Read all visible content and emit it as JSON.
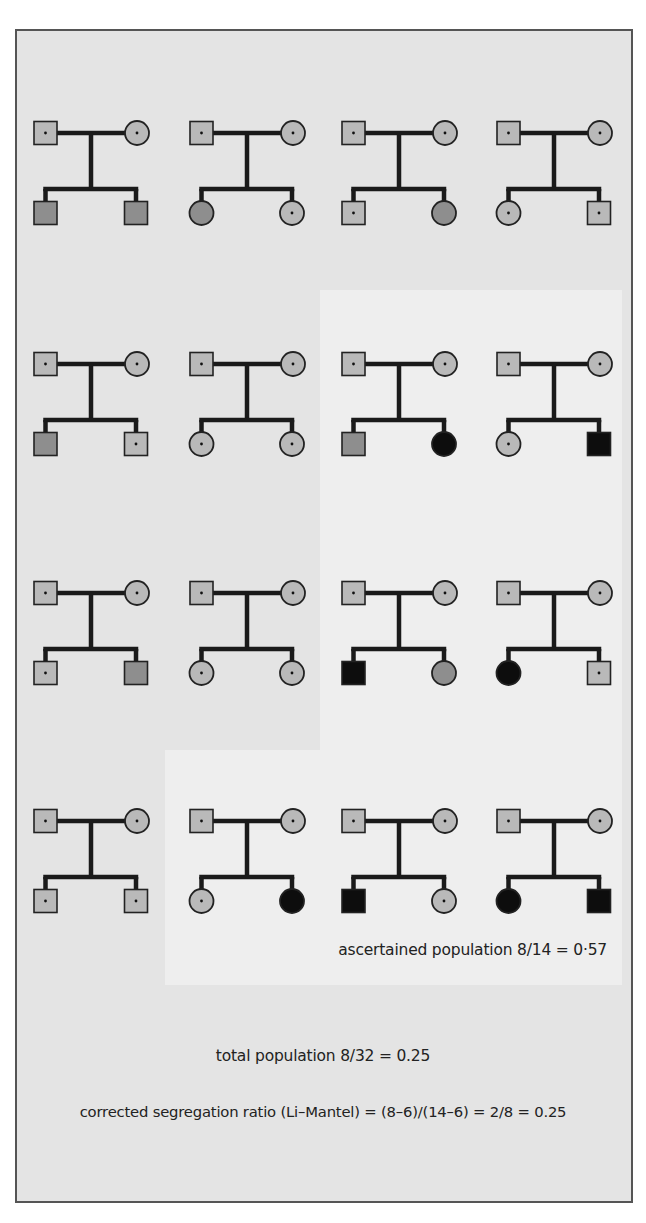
{
  "colors": {
    "frame_bg": "#e4e4e4",
    "panel_bg": "#eeeeee",
    "line": "#1a1a1a",
    "carrier_fill": "#b9b9b9",
    "gray_fill": "#8e8e8e",
    "affected_fill": "#0d0d0d",
    "border": "#555555"
  },
  "legend_semantics": {
    "dot": "carrier (unaffected heterozygote)",
    "gray": "unaffected non-carrier",
    "black": "affected"
  },
  "families": [
    {
      "row": 0,
      "col": 0,
      "children": [
        {
          "sex": "M",
          "state": "gray"
        },
        {
          "sex": "M",
          "state": "gray"
        }
      ]
    },
    {
      "row": 0,
      "col": 1,
      "children": [
        {
          "sex": "F",
          "state": "gray"
        },
        {
          "sex": "F",
          "state": "dot"
        }
      ]
    },
    {
      "row": 0,
      "col": 2,
      "children": [
        {
          "sex": "M",
          "state": "dot"
        },
        {
          "sex": "F",
          "state": "gray"
        }
      ]
    },
    {
      "row": 0,
      "col": 3,
      "children": [
        {
          "sex": "F",
          "state": "dot"
        },
        {
          "sex": "M",
          "state": "dot"
        }
      ]
    },
    {
      "row": 1,
      "col": 0,
      "children": [
        {
          "sex": "M",
          "state": "gray"
        },
        {
          "sex": "M",
          "state": "dot"
        }
      ]
    },
    {
      "row": 1,
      "col": 1,
      "children": [
        {
          "sex": "F",
          "state": "dot"
        },
        {
          "sex": "F",
          "state": "dot"
        }
      ]
    },
    {
      "row": 1,
      "col": 2,
      "children": [
        {
          "sex": "M",
          "state": "gray"
        },
        {
          "sex": "F",
          "state": "black"
        }
      ]
    },
    {
      "row": 1,
      "col": 3,
      "children": [
        {
          "sex": "F",
          "state": "dot"
        },
        {
          "sex": "M",
          "state": "black"
        }
      ]
    },
    {
      "row": 2,
      "col": 0,
      "children": [
        {
          "sex": "M",
          "state": "dot"
        },
        {
          "sex": "M",
          "state": "gray"
        }
      ]
    },
    {
      "row": 2,
      "col": 1,
      "children": [
        {
          "sex": "F",
          "state": "dot"
        },
        {
          "sex": "F",
          "state": "dot"
        }
      ]
    },
    {
      "row": 2,
      "col": 2,
      "children": [
        {
          "sex": "M",
          "state": "black"
        },
        {
          "sex": "F",
          "state": "gray"
        }
      ]
    },
    {
      "row": 2,
      "col": 3,
      "children": [
        {
          "sex": "F",
          "state": "black"
        },
        {
          "sex": "M",
          "state": "dot"
        }
      ]
    },
    {
      "row": 3,
      "col": 0,
      "children": [
        {
          "sex": "M",
          "state": "dot"
        },
        {
          "sex": "M",
          "state": "dot"
        }
      ]
    },
    {
      "row": 3,
      "col": 1,
      "children": [
        {
          "sex": "F",
          "state": "dot"
        },
        {
          "sex": "F",
          "state": "black"
        }
      ]
    },
    {
      "row": 3,
      "col": 2,
      "children": [
        {
          "sex": "M",
          "state": "black"
        },
        {
          "sex": "F",
          "state": "dot"
        }
      ]
    },
    {
      "row": 3,
      "col": 3,
      "children": [
        {
          "sex": "F",
          "state": "black"
        },
        {
          "sex": "M",
          "state": "black"
        }
      ]
    }
  ],
  "parents": {
    "father": {
      "sex": "M",
      "state": "dot"
    },
    "mother": {
      "sex": "F",
      "state": "dot"
    }
  },
  "captions": {
    "ascertained": "ascertained population 8/14 = 0·57",
    "total": "total population 8/32 = 0.25",
    "corrected": "corrected segregation ratio (Li–Mantel) = (8–6)/(14–6) = 2/8 = 0.25"
  }
}
